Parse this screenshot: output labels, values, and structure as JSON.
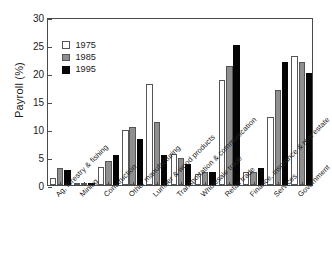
{
  "chart_data": {
    "type": "bar",
    "title": "",
    "xlabel": "",
    "ylabel": "Payroll (%)",
    "ylim": [
      0,
      30
    ],
    "yticks": [
      0,
      5,
      10,
      15,
      20,
      25,
      30
    ],
    "grid": false,
    "legend_position": "top-left",
    "categories": [
      "Ag, forestry & fishing",
      "Mining",
      "Construction",
      "Other manufacturing",
      "Lumber & wood products",
      "Transportation & communication",
      "Wholesale trade",
      "Retail trade",
      "Finance, insurance & real estate",
      "Services",
      "Government"
    ],
    "series": [
      {
        "name": "1975",
        "color": "#ffffff",
        "values": [
          1.3,
          0.3,
          3.3,
          9.8,
          18.0,
          5.5,
          2.0,
          18.7,
          2.4,
          12.2,
          23.0
        ]
      },
      {
        "name": "1985",
        "color": "#8f8f8f",
        "values": [
          3.0,
          0.4,
          4.2,
          10.3,
          11.3,
          4.8,
          2.4,
          21.3,
          2.4,
          17.0,
          22.0
        ]
      },
      {
        "name": "1995",
        "color": "#050505",
        "values": [
          2.7,
          0.3,
          5.3,
          8.2,
          5.3,
          3.8,
          2.4,
          25.0,
          3.0,
          22.0,
          20.0
        ]
      }
    ]
  },
  "legend": {
    "entries": [
      {
        "label": "1975"
      },
      {
        "label": "1985"
      },
      {
        "label": "1995"
      }
    ]
  },
  "axis": {
    "y_title": "Payroll (%)"
  }
}
